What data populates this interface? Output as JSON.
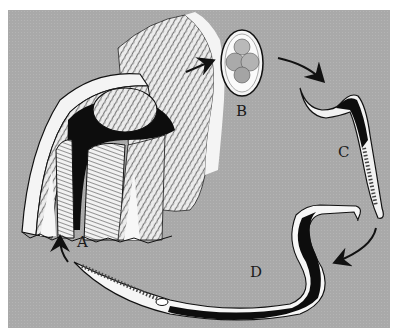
{
  "figure": {
    "background_color": "#a9a9a9",
    "labels": {
      "a": "A",
      "b": "B",
      "c": "C",
      "d": "D"
    },
    "stages": [
      {
        "label": "A",
        "depiction": "skin-cross-section-with-hair-follicle"
      },
      {
        "label": "B",
        "depiction": "egg-with-cleaving-cells"
      },
      {
        "label": "C",
        "depiction": "rhabditiform-larva"
      },
      {
        "label": "D",
        "depiction": "filariform-larva"
      }
    ]
  }
}
